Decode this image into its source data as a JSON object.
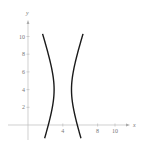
{
  "chart_data": {
    "type": "line",
    "title": "",
    "equation": "(x-4)^2 - (y-4)^2/9 = 1",
    "xlabel": "x",
    "ylabel": "y",
    "xlim": [
      -3,
      12
    ],
    "ylim": [
      -1.6,
      12.5
    ],
    "grid": false,
    "x_ticks": [
      4,
      8,
      10
    ],
    "x_tick_labels": [
      "4",
      "8",
      "10"
    ],
    "y_ticks": [
      2,
      4,
      6,
      8,
      10
    ],
    "y_tick_labels": [
      "2",
      "4",
      "6",
      "8",
      "10"
    ],
    "series": [
      {
        "name": "left branch",
        "x": [
          1.6,
          2.1,
          2.6,
          2.9,
          3.0,
          2.9,
          2.6,
          2.1,
          1.7
        ],
        "y": [
          10.3,
          8.6,
          6.9,
          5.4,
          4.0,
          2.6,
          1.1,
          -0.6,
          -1.5
        ]
      },
      {
        "name": "right branch",
        "x": [
          6.4,
          5.9,
          5.4,
          5.1,
          5.0,
          5.1,
          5.4,
          5.9,
          6.3
        ],
        "y": [
          10.3,
          8.6,
          6.9,
          5.4,
          4.0,
          2.6,
          1.1,
          -0.6,
          -1.5
        ]
      }
    ],
    "colors": {
      "curve": "#1a1a1a",
      "axis": "#bbbbbb",
      "text": "#777777"
    }
  }
}
